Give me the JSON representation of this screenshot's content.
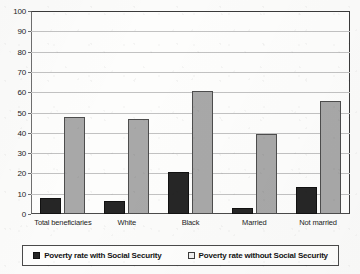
{
  "chart_data": {
    "type": "bar",
    "title": "",
    "subtitle": "",
    "xlabel": "",
    "ylabel": "",
    "ylim": [
      0,
      100
    ],
    "y_ticks": [
      0,
      10,
      20,
      30,
      40,
      50,
      60,
      70,
      80,
      90,
      100
    ],
    "y_tick_labels": [
      "0",
      "10",
      "20",
      "30",
      "40",
      "50",
      "60",
      "70",
      "80",
      "90",
      "100"
    ],
    "grid": true,
    "legend_position": "bottom",
    "categories": [
      "Total beneficiaries",
      "White",
      "Black",
      "Married",
      "Not married"
    ],
    "series": [
      {
        "name": "Poverty rate with Social Security",
        "color": "#262626",
        "values": [
          8,
          6.5,
          20.5,
          3,
          13.5
        ]
      },
      {
        "name": "Poverty rate without Social Security",
        "color": "#a8a8a8",
        "values": [
          48,
          47,
          60.5,
          39.5,
          55.5
        ]
      }
    ]
  },
  "legend": {
    "items": [
      {
        "label": "Poverty rate with Social Security",
        "swatch": "dark-swatch-icon"
      },
      {
        "label": "Poverty rate without Social Security",
        "swatch": "light-swatch-icon"
      }
    ]
  },
  "colors": {
    "series_with": "#262626",
    "series_without": "#a8a8a8",
    "gridline": "#c2c2c2",
    "axis": "#3a3a3a",
    "plot_background": "#fdfdfc",
    "page_background": "#fbfbfa"
  }
}
